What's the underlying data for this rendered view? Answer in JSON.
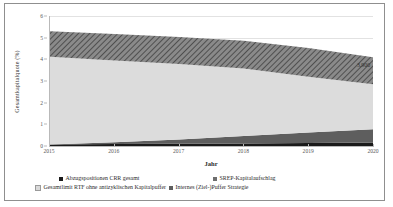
{
  "chart_data": {
    "type": "area",
    "stacked": true,
    "title": "",
    "xlabel": "Jahr",
    "ylabel": "Gesamtkapitalquote (%)",
    "categories": [
      "2015",
      "2016",
      "2017",
      "2018",
      "2019",
      "2020"
    ],
    "x": [
      2015,
      2016,
      2017,
      2018,
      2019,
      2020
    ],
    "ylim": [
      0,
      6
    ],
    "yticks": [
      "0",
      "1",
      "2",
      "3",
      "4",
      "5",
      "6"
    ],
    "ytick_values": [
      0,
      1,
      2,
      3,
      4,
      5,
      6
    ],
    "grid": true,
    "legend_position": "bottom",
    "series": [
      {
        "name": "Abzugspositionen CRR gesamt",
        "color": "#1a1a1a",
        "fill": "solid-black",
        "values": [
          0.07,
          0.09,
          0.1,
          0.12,
          0.14,
          0.16
        ]
      },
      {
        "name": "Internes (Ziel-)Puffer Strategie",
        "color": "#5e5e5e",
        "fill": "solid-dark-gray",
        "values": [
          0.0,
          0.08,
          0.2,
          0.34,
          0.48,
          0.61
        ]
      },
      {
        "name": "Gesamtlimit RTF ohne antizyklischen Kapitalpuffer",
        "color": "#dcdcdc",
        "fill": "solid-light-gray",
        "values": [
          4.05,
          3.78,
          3.48,
          3.12,
          2.58,
          2.08
        ]
      },
      {
        "name": "SREP-Kapitalaufschlag",
        "color": "#6e6e6e",
        "fill": "hatched-diagonal",
        "values": [
          1.18,
          1.22,
          1.25,
          1.28,
          1.32,
          1.25
        ]
      }
    ],
    "totals": [
      5.3,
      5.17,
      5.03,
      4.86,
      4.52,
      4.1
    ],
    "annotations": [
      {
        "text": "3,900",
        "x": 2020,
        "y": 3.9,
        "series": "total-end-label"
      }
    ]
  },
  "axes": {
    "y_title": "Gesamtkapitalquote (%)",
    "x_title": "Jahr",
    "y_ticks": [
      "6",
      "5",
      "4",
      "3",
      "2",
      "1",
      "0"
    ],
    "x_ticks": [
      "2015",
      "2016",
      "2017",
      "2018",
      "2019",
      "2020"
    ]
  },
  "value_label": {
    "text": "3,900"
  },
  "legend": {
    "items": [
      {
        "label": "Abzugspositionen CRR gesamt",
        "swatch": "sw-black"
      },
      {
        "label": "SREP-Kapitalaufschlag",
        "swatch": "sw-hatch"
      },
      {
        "label": "Gesamtlimit RTF ohne antizyklischen Kapitalpuffer",
        "swatch": "sw-light"
      },
      {
        "label": "Internes (Ziel-)Puffer Strategie",
        "swatch": "sw-dark"
      }
    ]
  },
  "colors": {
    "deductions": "#1a1a1a",
    "internal_buffer": "#5e5e5e",
    "rtf_limit": "#dcdcdc",
    "srep_surcharge": "#6e6e6e",
    "gridline": "#e2e2e2",
    "axis": "#b9b9b9",
    "border": "#8f8f8f"
  }
}
